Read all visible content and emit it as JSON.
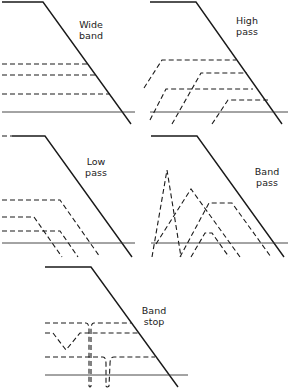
{
  "diagram": {
    "panels": [
      {
        "id": "wide-band",
        "label_line1": "Wide",
        "label_line2": "band"
      },
      {
        "id": "high-pass",
        "label_line1": "High",
        "label_line2": "pass"
      },
      {
        "id": "low-pass",
        "label_line1": "Low",
        "label_line2": "pass"
      },
      {
        "id": "band-pass",
        "label_line1": "Band",
        "label_line2": "pass"
      },
      {
        "id": "band-stop",
        "label_line1": "Band",
        "label_line2": "stop"
      }
    ],
    "colors": {
      "line": "#1a1a1a",
      "background": "#ffffff"
    }
  }
}
